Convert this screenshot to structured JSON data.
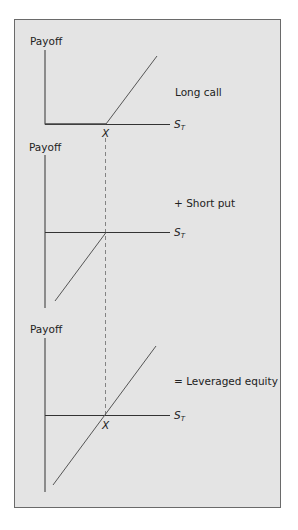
{
  "figure": {
    "panels": [
      {
        "id": "long-call",
        "y_label": "Payoff",
        "x_label": "S",
        "x_label_sub": "T",
        "strike_label": "X",
        "caption": "Long call"
      },
      {
        "id": "short-put",
        "y_label": "Payoff",
        "x_label": "S",
        "x_label_sub": "T",
        "caption": "+ Short put"
      },
      {
        "id": "leveraged-equity",
        "y_label": "Payoff",
        "x_label": "S",
        "x_label_sub": "T",
        "strike_label": "X",
        "caption": "= Leveraged equity"
      }
    ],
    "colors": {
      "background": "#e4e4e4",
      "line": "#555555",
      "axis": "#333333",
      "border": "#6a6a6a"
    }
  }
}
